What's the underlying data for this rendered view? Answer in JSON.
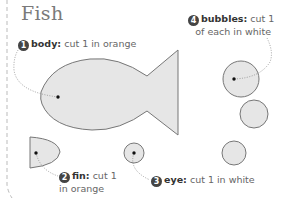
{
  "title": "Fish",
  "colors": {
    "piece_fill": "#e6e6e6",
    "piece_stroke": "#777777",
    "badge": "#444444",
    "text": "#666666",
    "title": "#7a7a7a"
  },
  "callouts": [
    {
      "number": "1",
      "part": "body:",
      "instruction": "cut 1 in orange"
    },
    {
      "number": "2",
      "part": "fin:",
      "instruction_line1": "cut 1",
      "instruction_line2": "in orange"
    },
    {
      "number": "3",
      "part": "eye:",
      "instruction": "cut 1 in white"
    },
    {
      "number": "4",
      "part": "bubbles:",
      "instruction_line1": "cut 1",
      "instruction_line2": "of each in white"
    }
  ],
  "pieces": [
    "fish-body",
    "fin",
    "eye",
    "bubble-large",
    "bubble-medium",
    "bubble-small"
  ]
}
